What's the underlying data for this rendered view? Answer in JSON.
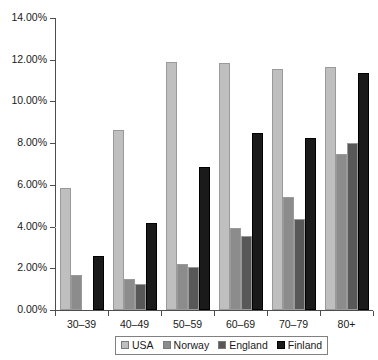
{
  "chart_data": {
    "type": "bar",
    "title": "",
    "xlabel": "",
    "ylabel": "",
    "categories": [
      "30–39",
      "40–49",
      "50–59",
      "60–69",
      "70–79",
      "80+"
    ],
    "series": [
      {
        "name": "USA",
        "color": "#bfbfbf",
        "values": [
          5.85,
          8.65,
          11.9,
          11.85,
          11.55,
          11.65
        ]
      },
      {
        "name": "Norway",
        "color": "#8c8c8c",
        "values": [
          1.7,
          1.5,
          2.2,
          3.95,
          5.4,
          7.5
        ]
      },
      {
        "name": "England",
        "color": "#585858",
        "values": [
          0.0,
          1.25,
          2.05,
          3.55,
          4.35,
          8.0
        ]
      },
      {
        "name": "Finland",
        "color": "#1a1a1a",
        "values": [
          2.6,
          4.15,
          6.85,
          8.5,
          8.25,
          11.35
        ]
      }
    ],
    "ylim": [
      0,
      14
    ],
    "ytick_values": [
      0,
      2,
      4,
      6,
      8,
      10,
      12,
      14
    ],
    "ytick_labels": [
      "0.00%",
      "2.00%",
      "4.00%",
      "6.00%",
      "8.00%",
      "10.00%",
      "12.00%",
      "14.00%"
    ],
    "grid": true,
    "gridline_values": [
      4
    ],
    "legend": {
      "position": "bottom",
      "entries": [
        {
          "label": "USA",
          "color": "#bfbfbf"
        },
        {
          "label": "Norway",
          "color": "#8c8c8c"
        },
        {
          "label": "England",
          "color": "#585858"
        },
        {
          "label": "Finland",
          "color": "#1a1a1a"
        }
      ]
    },
    "axis_color": "#4d4d4d",
    "background": "#ffffff"
  }
}
